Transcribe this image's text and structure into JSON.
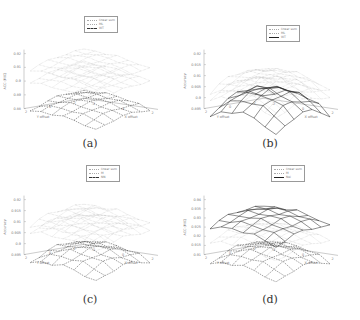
{
  "figure": {
    "captions": [
      "(a)",
      "(b)",
      "(c)",
      "(d)"
    ]
  },
  "chart_data": [
    {
      "type": "surface3d",
      "panel": "(a)",
      "xlabel": "X offset",
      "ylabel": "Y offset",
      "zlabel": "ACC (MIC)",
      "x_ticks": [
        "-2",
        "0",
        "2"
      ],
      "y_ticks": [
        "2",
        "0",
        "-2"
      ],
      "z_ticks": [
        "0.92",
        "0.91",
        "0.9",
        "0.89",
        "0.88"
      ],
      "zlim": [
        0.88,
        0.92
      ],
      "legend": [
        "linear sum",
        "ML",
        "WT"
      ],
      "series": [
        {
          "name": "linear sum",
          "style": "dotted",
          "level": 0.915,
          "curvature": 0.004
        },
        {
          "name": "ML",
          "style": "dotted",
          "level": 0.905,
          "curvature": 0.003
        },
        {
          "name": "WT",
          "style": "dashed",
          "level": 0.887,
          "curvature": 0.006
        }
      ]
    },
    {
      "type": "surface3d",
      "panel": "(b)",
      "xlabel": "X offset",
      "ylabel": "Y offset",
      "zlabel": "Accuracy",
      "x_ticks": [
        "-2",
        "0",
        "2"
      ],
      "y_ticks": [
        "2",
        "0",
        "-2"
      ],
      "z_ticks": [
        "0.92",
        "0.915",
        "0.91",
        "0.905",
        "0.9",
        "0.895"
      ],
      "zlim": [
        0.895,
        0.92
      ],
      "legend": [
        "linear sum",
        "ML",
        "WT"
      ],
      "series": [
        {
          "name": "linear sum",
          "style": "dotted",
          "level": 0.912,
          "curvature": 0.008
        },
        {
          "name": "ML",
          "style": "dotted",
          "level": 0.908,
          "curvature": 0.007
        },
        {
          "name": "WT",
          "style": "solid",
          "level": 0.905,
          "curvature": 0.012
        }
      ]
    },
    {
      "type": "surface3d",
      "panel": "(c)",
      "xlabel": "X offset",
      "ylabel": "Y offset",
      "zlabel": "Accuracy",
      "x_ticks": [
        "-2",
        "0",
        "2"
      ],
      "y_ticks": [
        "2",
        "0",
        "-2"
      ],
      "z_ticks": [
        "0.92",
        "0.915",
        "0.91",
        "0.905",
        "0.9",
        "0.895"
      ],
      "zlim": [
        0.895,
        0.92
      ],
      "legend": [
        "linear sum",
        "M",
        "NN"
      ],
      "series": [
        {
          "name": "linear sum",
          "style": "dotted",
          "level": 0.914,
          "curvature": 0.004
        },
        {
          "name": "M",
          "style": "dotted",
          "level": 0.91,
          "curvature": 0.003
        },
        {
          "name": "NN",
          "style": "dashed",
          "level": 0.899,
          "curvature": 0.006
        }
      ]
    },
    {
      "type": "surface3d",
      "panel": "(d)",
      "xlabel": "X offset",
      "ylabel": "Y offset",
      "zlabel": "ACC (MIC)",
      "x_ticks": [
        "-2",
        "0",
        "2"
      ],
      "y_ticks": [
        "2",
        "0",
        "-2"
      ],
      "z_ticks": [
        "0.94",
        "0.935",
        "0.93",
        "0.925",
        "0.92",
        "0.915",
        "0.91"
      ],
      "zlim": [
        0.91,
        0.94
      ],
      "legend": [
        "linear sum",
        "M",
        "Nei"
      ],
      "series": [
        {
          "name": "Nei",
          "style": "solid",
          "level": 0.933,
          "curvature": 0.006
        },
        {
          "name": "linear sum",
          "style": "dotted",
          "level": 0.924,
          "curvature": 0.005
        },
        {
          "name": "M",
          "style": "dashed",
          "level": 0.915,
          "curvature": 0.008
        }
      ]
    }
  ]
}
